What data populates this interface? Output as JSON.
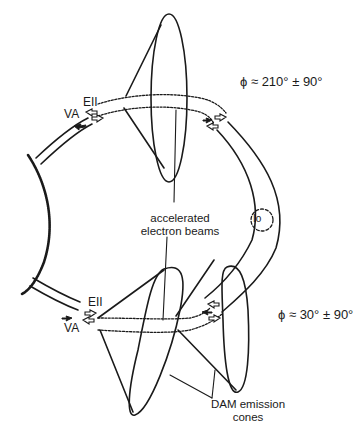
{
  "diagram": {
    "type": "schematic",
    "labels": {
      "phi_north": "ϕ ≈ 210° ± 90°",
      "phi_south": "ϕ ≈ 30° ± 90°",
      "beams_line1": "accelerated",
      "beams_line2": "electron beams",
      "io": "Io",
      "dam_line1": "DAM emission",
      "dam_line2": "cones",
      "va_top_main": "V",
      "va_top_sub": "A",
      "ep_top_main": "E",
      "ep_top_sub": "II",
      "va_bot_main": "V",
      "va_bot_sub": "A",
      "ep_bot_main": "E",
      "ep_bot_sub": "II"
    },
    "colors": {
      "ink": "#1a1a1a",
      "background": "#ffffff"
    }
  }
}
